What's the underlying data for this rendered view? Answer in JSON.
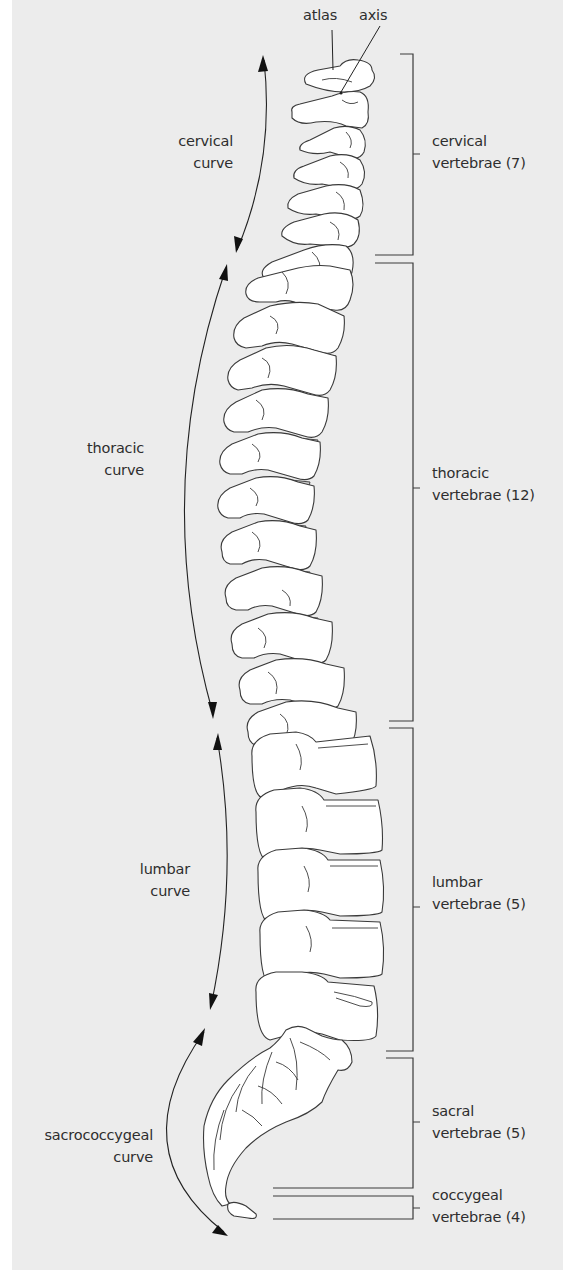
{
  "figure": {
    "background_color": "#ececec",
    "line_color": "#3a3a3a",
    "text_color": "#2e2e2e"
  },
  "pointer_labels": {
    "atlas": "atlas",
    "axis": "axis"
  },
  "curves": [
    {
      "id": "cervical",
      "line1": "cervical",
      "line2": "curve"
    },
    {
      "id": "thoracic",
      "line1": "thoracic",
      "line2": "curve"
    },
    {
      "id": "lumbar",
      "line1": "lumbar",
      "line2": "curve"
    },
    {
      "id": "sacrococcygeal",
      "line1": "sacrococcygeal",
      "line2": "curve"
    }
  ],
  "regions": [
    {
      "id": "cervical",
      "line1": "cervical",
      "line2": "vertebrae (7)",
      "count": 7
    },
    {
      "id": "thoracic",
      "line1": "thoracic",
      "line2": "vertebrae (12)",
      "count": 12
    },
    {
      "id": "lumbar",
      "line1": "lumbar",
      "line2": "vertebrae (5)",
      "count": 5
    },
    {
      "id": "sacral",
      "line1": "sacral",
      "line2": "vertebrae (5)",
      "count": 5
    },
    {
      "id": "coccygeal",
      "line1": "coccygeal",
      "line2": "vertebrae (4)",
      "count": 4
    }
  ]
}
